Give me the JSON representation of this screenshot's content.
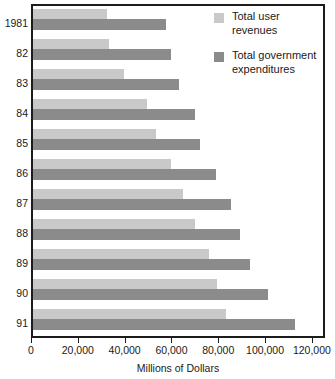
{
  "chart_data": {
    "type": "bar",
    "orientation": "horizontal",
    "title": "",
    "xlabel": "Millions of Dollars",
    "ylabel": "",
    "xlim": [
      0,
      125600
    ],
    "xticks": [
      0,
      20000,
      40000,
      60000,
      80000,
      100000,
      120000
    ],
    "xticklabels": [
      "0",
      "20,000",
      "40,000",
      "60,000",
      "80,000",
      "100,000",
      "120,000"
    ],
    "grid": false,
    "legend_position": "top-right",
    "categories": [
      "1981",
      "82",
      "83",
      "84",
      "85",
      "86",
      "87",
      "88",
      "89",
      "90",
      "91"
    ],
    "series": [
      {
        "name": "Total user revenues",
        "color": "#c9c9c9",
        "values": [
          31500,
          32500,
          39000,
          48500,
          52500,
          59000,
          64000,
          69000,
          75000,
          78500,
          82500
        ]
      },
      {
        "name": "Total government expenditures",
        "color": "#8b8b8b",
        "values": [
          57000,
          59000,
          62500,
          69000,
          71500,
          78000,
          84500,
          88500,
          92500,
          100500,
          112000
        ]
      }
    ]
  },
  "legend": {
    "items": [
      {
        "label_line1": "Total user",
        "label_line2": "revenues",
        "swatch": "light-swatch"
      },
      {
        "label_line1": "Total government",
        "label_line2": "expenditures",
        "swatch": "dark-swatch"
      }
    ]
  },
  "colors": {
    "user_revenues": "#c9c9c9",
    "government_expenditures": "#8b8b8b",
    "frame": "#1c1c1c",
    "text": "#1a1a1a",
    "background": "#ffffff"
  }
}
